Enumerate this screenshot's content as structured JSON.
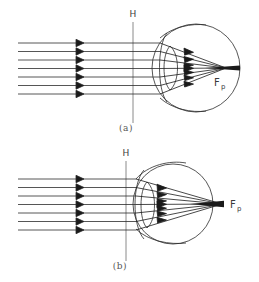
{
  "figure": {
    "type": "optics-ray-diagram",
    "panels": [
      {
        "id": "a",
        "caption": "(a)",
        "condition_label": "focal point on retina",
        "principal_plane_label": "H",
        "focal_point_label": "F",
        "focal_point_subscript": "p",
        "ray_count": 7,
        "focus_inside_eye": true
      },
      {
        "id": "b",
        "caption": "(b)",
        "condition_label": "focal point behind eye",
        "principal_plane_label": "H",
        "focal_point_label": "F",
        "focal_point_subscript": "p",
        "ray_count": 7,
        "focus_inside_eye": false
      }
    ],
    "colors": {
      "ink": "#1a1a1a",
      "ray": "#2b2b2b",
      "outline": "#2b2b2b",
      "label": "#3a3a3a",
      "caption": "#555555",
      "background": "#ffffff"
    },
    "footer_fragment": ""
  }
}
